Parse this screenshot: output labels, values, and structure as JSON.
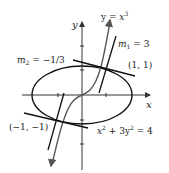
{
  "figure": {
    "axes": {
      "x_label": "x",
      "y_label": "y"
    },
    "curves": {
      "cubic": {
        "label_prefix": "y = ",
        "label_var": "x",
        "label_exp": "3"
      },
      "ellipse": {
        "label_a": "x",
        "label_b": " + 3y",
        "label_c": " = 4",
        "exp": "2"
      }
    },
    "tangents": {
      "m1": {
        "sym": "m",
        "sub": "1",
        "value": " = 3"
      },
      "m2": {
        "sym": "m",
        "sub": "2",
        "value": " = −1/3"
      }
    },
    "points": {
      "p1": "(1, 1)",
      "p2": "(−1, −1)"
    },
    "colors": {
      "ink": "#111111",
      "cubic": "#555555",
      "axis": "#333333"
    }
  }
}
